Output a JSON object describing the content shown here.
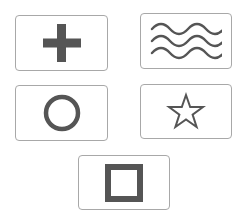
{
  "colors": {
    "shape": "#555555",
    "card_border": "#a8a8a8",
    "background": "#ffffff"
  },
  "cards": [
    {
      "id": "plus",
      "icon": "plus-icon"
    },
    {
      "id": "waves",
      "icon": "waves-icon"
    },
    {
      "id": "circle",
      "icon": "circle-icon"
    },
    {
      "id": "star",
      "icon": "star-icon"
    },
    {
      "id": "square",
      "icon": "square-icon"
    }
  ]
}
